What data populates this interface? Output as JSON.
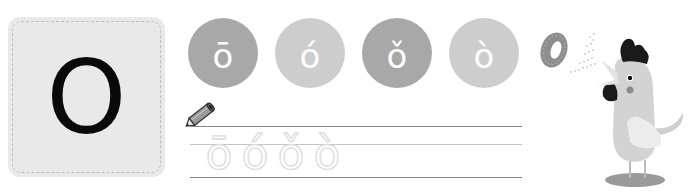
{
  "letter_card": {
    "letter": "O"
  },
  "tone_circles": [
    {
      "label": "ō",
      "tone": "first",
      "shade": "dark",
      "color": "#a8a8a8"
    },
    {
      "label": "ó",
      "tone": "second",
      "shade": "light",
      "color": "#cdcdcd"
    },
    {
      "label": "ǒ",
      "tone": "third",
      "shade": "dark",
      "color": "#a8a8a8"
    },
    {
      "label": "ò",
      "tone": "fourth",
      "shade": "light",
      "color": "#cdcdcd"
    }
  ],
  "tracing": {
    "letters": [
      "ō",
      "ó",
      "ǒ",
      "ò"
    ]
  },
  "illustration": {
    "subject": "rooster crowing letter o",
    "letter": "o"
  }
}
